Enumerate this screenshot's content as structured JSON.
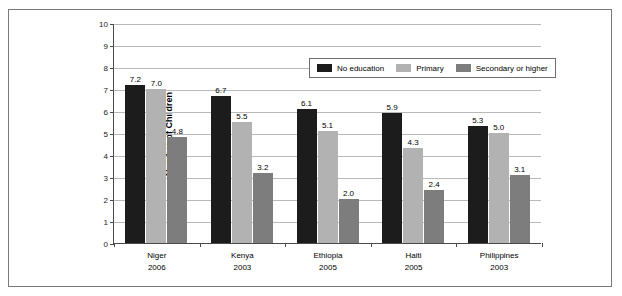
{
  "chart_data": {
    "type": "bar",
    "title": "",
    "xlabel": "",
    "ylabel": "Number of Children",
    "ylim": [
      0,
      10
    ],
    "ytick_labels": [
      "10",
      "9",
      "8",
      "7",
      "6",
      "5",
      "4",
      "3",
      "2",
      "1",
      "0"
    ],
    "ytick_values": [
      10,
      9,
      8,
      7,
      6,
      5,
      4,
      3,
      2,
      1,
      0
    ],
    "grid": true,
    "legend_position": "top-right-inside",
    "categories": [
      {
        "name": "Niger",
        "year": "2006"
      },
      {
        "name": "Kenya",
        "year": "2003"
      },
      {
        "name": "Ethiopia",
        "year": "2005"
      },
      {
        "name": "Haiti",
        "year": "2005"
      },
      {
        "name": "Philippines",
        "year": "2003"
      }
    ],
    "series": [
      {
        "name": "No education",
        "color": "#1c1c1c",
        "values": [
          7.2,
          6.7,
          6.1,
          5.9,
          5.3
        ],
        "labels": [
          "7.2",
          "6.7",
          "6.1",
          "5.9",
          "5.3"
        ]
      },
      {
        "name": "Primary",
        "color": "#b2b2b2",
        "values": [
          7.0,
          5.5,
          5.1,
          4.3,
          5.0
        ],
        "labels": [
          "7.0",
          "5.5",
          "5.1",
          "4.3",
          "5.0"
        ]
      },
      {
        "name": "Secondary or higher",
        "color": "#7d7d7d",
        "values": [
          4.8,
          3.2,
          2.0,
          2.4,
          3.1
        ],
        "labels": [
          "4.8",
          "3.2",
          "2.0",
          "2.4",
          "3.1"
        ]
      }
    ]
  },
  "axis": {
    "y_title": "Number of Children",
    "y_labels": [
      "10",
      "9",
      "8",
      "7",
      "6",
      "5",
      "4",
      "3",
      "2",
      "1",
      "0"
    ],
    "x_categories": [
      "Niger",
      "Kenya",
      "Ethiopia",
      "Haiti",
      "Philippines"
    ],
    "x_years": [
      "2006",
      "2003",
      "2005",
      "2005",
      "2003"
    ]
  },
  "legend": {
    "items": [
      {
        "label": "No education",
        "color": "#1c1c1c"
      },
      {
        "label": "Primary",
        "color": "#b2b2b2"
      },
      {
        "label": "Secondary or higher",
        "color": "#7d7d7d"
      }
    ]
  }
}
